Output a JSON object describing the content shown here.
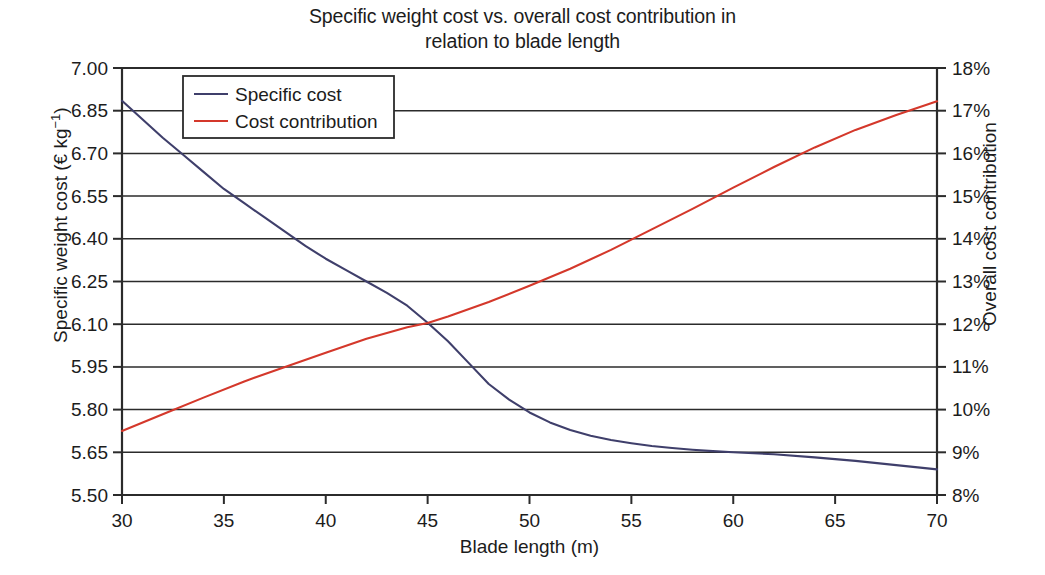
{
  "chart_data": {
    "type": "line",
    "title": "Specific weight cost vs. overall cost contribution in\nrelation to blade length",
    "xlabel": "Blade length (m)",
    "ylabel": "Specific weight cost (€ kg",
    "ylabel_sup": "−1",
    "ylabel_suffix": ")",
    "y2label": "Overall cost contribution",
    "xlim": [
      30,
      70
    ],
    "ylim": [
      5.5,
      7.0
    ],
    "y2lim": [
      8,
      18
    ],
    "grid": true,
    "legend_position": "top-left",
    "xticks": [
      30,
      35,
      40,
      45,
      50,
      55,
      60,
      65,
      70
    ],
    "xtick_labels": [
      "30",
      "35",
      "40",
      "45",
      "50",
      "55",
      "60",
      "65",
      "70"
    ],
    "yticks": [
      5.5,
      5.65,
      5.8,
      5.95,
      6.1,
      6.25,
      6.4,
      6.55,
      6.7,
      6.85,
      7.0
    ],
    "ytick_labels": [
      "5.50",
      "5.65",
      "5.80",
      "5.95",
      "6.10",
      "6.25",
      "6.40",
      "6.55",
      "6.70",
      "6.85",
      "7.00"
    ],
    "y2ticks": [
      8,
      9,
      10,
      11,
      12,
      13,
      14,
      15,
      16,
      17,
      18
    ],
    "y2tick_labels": [
      "8%",
      "9%",
      "10%",
      "11%",
      "12%",
      "13%",
      "14%",
      "15%",
      "16%",
      "17%",
      "18%"
    ],
    "series": [
      {
        "name": "Specific cost",
        "color": "#3f3f6b",
        "axis": "left",
        "x": [
          30,
          31,
          32,
          33,
          34,
          35,
          36,
          37,
          38,
          39,
          40,
          41,
          42,
          43,
          44,
          45,
          46,
          47,
          48,
          49,
          50,
          51,
          52,
          53,
          54,
          55,
          56,
          57,
          58,
          59,
          60,
          62,
          64,
          66,
          68,
          70
        ],
        "y": [
          6.885,
          6.82,
          6.755,
          6.695,
          6.635,
          6.575,
          6.525,
          6.475,
          6.425,
          6.375,
          6.33,
          6.29,
          6.25,
          6.21,
          6.165,
          6.105,
          6.04,
          5.965,
          5.89,
          5.835,
          5.79,
          5.755,
          5.728,
          5.708,
          5.693,
          5.682,
          5.672,
          5.665,
          5.659,
          5.654,
          5.65,
          5.643,
          5.632,
          5.62,
          5.605,
          5.59
        ]
      },
      {
        "name": "Cost contribution",
        "color": "#d4382b",
        "axis": "right",
        "x": [
          30,
          32,
          34,
          36,
          38,
          40,
          42,
          44,
          45,
          46,
          48,
          50,
          52,
          54,
          55,
          56,
          58,
          60,
          62,
          64,
          66,
          68,
          70
        ],
        "y": [
          9.5,
          9.89,
          10.28,
          10.66,
          11.0,
          11.33,
          11.66,
          11.93,
          12.03,
          12.18,
          12.52,
          12.9,
          13.3,
          13.74,
          13.98,
          14.22,
          14.7,
          15.2,
          15.68,
          16.14,
          16.55,
          16.9,
          17.22
        ]
      }
    ]
  },
  "legend": {
    "entries": [
      {
        "label": "Specific cost",
        "color": "#3f3f6b"
      },
      {
        "label": "Cost contribution",
        "color": "#d4382b"
      }
    ]
  }
}
